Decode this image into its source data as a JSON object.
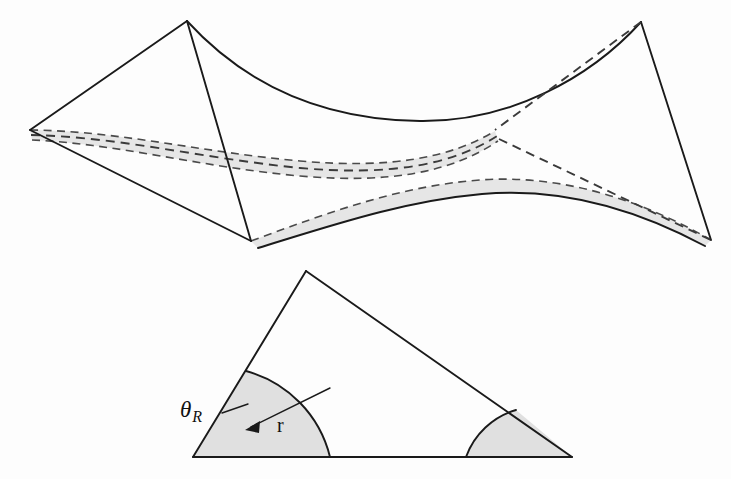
{
  "figure": {
    "background_color": "#fdfdfd",
    "line_color": "#1a1a1a",
    "shade_color": "#e3e3e3",
    "dash_color": "#3a3a3a",
    "labels": {
      "theta_symbol": "θ",
      "theta_subscript": "R",
      "radius_symbol": "r"
    },
    "upper_panel": {
      "name": "saddle-surface-diagram",
      "description": "Hyperbolic saddle shaped quadrilateral surface with shaded geodesic band",
      "vertices": {
        "top_left": [
          187,
          21
        ],
        "top_right": [
          641,
          22
        ],
        "left": [
          30,
          130
        ],
        "right_hidden": [
          497,
          133
        ],
        "bottom_front": [
          251,
          241
        ],
        "bottom_right": [
          711,
          240
        ]
      },
      "band": {
        "name": "shaded-band",
        "fill": "#e3e3e3",
        "edge_style": "dashed",
        "center_line_style": "dashed"
      }
    },
    "lower_panel": {
      "name": "triangle-diagram",
      "description": "Triangle with two shaded corner regions bounded by circular arcs of radius r",
      "vertices": {
        "apex": [
          306,
          271
        ],
        "bottom_left": [
          193,
          457
        ],
        "bottom_right": [
          572,
          457
        ]
      },
      "arc_radius_px": 118,
      "corner_left": {
        "name": "shaded-corner-left",
        "fill": "#e0e0e0",
        "angle_label": "θR"
      },
      "corner_right": {
        "name": "shaded-corner-right",
        "fill": "#e0e0e0"
      },
      "radius_arrow": {
        "name": "radius-arrow",
        "from": [
          327,
          390
        ],
        "to": [
          248,
          429
        ],
        "label": "r",
        "label_position": [
          283,
          426
        ]
      },
      "theta_leader": {
        "name": "theta-leader-line",
        "from": [
          224,
          412
        ],
        "to": [
          248,
          406
        ]
      }
    }
  }
}
